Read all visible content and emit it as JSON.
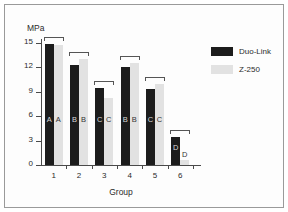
{
  "chart_data": {
    "type": "bar",
    "title": "",
    "xlabel": "Group",
    "ylabel": "MPa",
    "categories": [
      "1",
      "2",
      "3",
      "4",
      "5",
      "6"
    ],
    "ylim": [
      0,
      15
    ],
    "yticks": [
      0,
      3,
      6,
      9,
      12,
      15
    ],
    "ytick_labels": [
      "0",
      "3",
      "6",
      "9",
      "12",
      "15"
    ],
    "grid": false,
    "legend_position": "right",
    "series": [
      {
        "name": "Duo-Link",
        "color": "#1c1c1c",
        "values": [
          14.9,
          12.3,
          9.5,
          12.1,
          9.4,
          3.4
        ],
        "labels": [
          "A",
          "B",
          "C",
          "B",
          "C",
          "D"
        ]
      },
      {
        "name": "Z-250",
        "color": "#e2e2e2",
        "values": [
          14.7,
          13.0,
          8.3,
          12.6,
          10.0,
          0.6
        ],
        "labels": [
          "A",
          "B",
          "C",
          "B",
          "C",
          "D"
        ]
      }
    ],
    "annotations": {
      "brackets": [
        {
          "group": "1"
        },
        {
          "group": "2"
        },
        {
          "group": "3"
        },
        {
          "group": "4"
        },
        {
          "group": "5"
        },
        {
          "group": "6"
        }
      ]
    }
  },
  "axes": {
    "y_label": "MPa",
    "x_label": "Group"
  },
  "legend": {
    "items": [
      {
        "label": "Duo-Link",
        "color": "#1c1c1c"
      },
      {
        "label": "Z-250",
        "color": "#e2e2e2"
      }
    ]
  }
}
